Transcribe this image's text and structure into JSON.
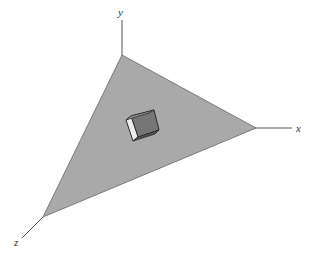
{
  "diagram": {
    "axes": [
      {
        "name": "x",
        "label": "x"
      },
      {
        "name": "y",
        "label": "y"
      },
      {
        "name": "z",
        "label": "z"
      }
    ],
    "plane": {
      "shape": "triangle",
      "fill": "#a9a9a9",
      "edge": "#7a7a7a"
    },
    "cube": {
      "top_face": "#7d7d7d",
      "front_face": "#6a6a6a",
      "side_face": "#ececec",
      "edge": "#2a2a2a"
    },
    "colors": {
      "axis_line": "#555555",
      "background": "#ffffff"
    }
  }
}
